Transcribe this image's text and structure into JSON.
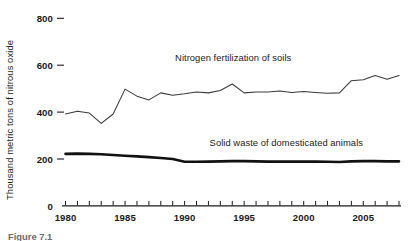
{
  "figure": {
    "caption": "Figure 7.1",
    "background_color": "#ffffff",
    "ink_color": "#1a1a1a"
  },
  "chart_data": {
    "type": "line",
    "title": "",
    "subtitle": "",
    "xlabel": "",
    "ylabel": "Thousand metric tons of nitrous oxide",
    "xlim": [
      1980,
      2008
    ],
    "ylim": [
      0,
      860
    ],
    "grid": false,
    "legend_position": "inline-annotation",
    "y_ticks": [
      0,
      200,
      400,
      600,
      800
    ],
    "y_tick_labels": [
      "0",
      "200",
      "400",
      "600",
      "800"
    ],
    "x_ticks": [
      1980,
      1981,
      1982,
      1983,
      1984,
      1985,
      1986,
      1987,
      1988,
      1989,
      1990,
      1991,
      1992,
      1993,
      1994,
      1995,
      1996,
      1997,
      1998,
      1999,
      2000,
      2001,
      2002,
      2003,
      2004,
      2005,
      2006,
      2007,
      2008
    ],
    "x_tick_labels_shown": [
      "1980",
      "1985",
      "1990",
      "1995",
      "2000",
      "2005"
    ],
    "x_tick_labels_shown_values": [
      1980,
      1985,
      1990,
      1995,
      2000,
      2005
    ],
    "x": [
      1980,
      1981,
      1982,
      1983,
      1984,
      1985,
      1986,
      1987,
      1988,
      1989,
      1990,
      1991,
      1992,
      1993,
      1994,
      1995,
      1996,
      1997,
      1998,
      1999,
      2000,
      2001,
      2002,
      2003,
      2004,
      2005,
      2006,
      2007,
      2008
    ],
    "series": [
      {
        "name": "Nitrogen fertilization of soils",
        "style": "thin",
        "color": "#3a3a3a",
        "label_x": 1989.2,
        "label_y": 618,
        "values": [
          392,
          404,
          396,
          352,
          392,
          498,
          468,
          452,
          482,
          472,
          478,
          486,
          482,
          492,
          520,
          482,
          486,
          486,
          490,
          484,
          488,
          484,
          480,
          482,
          534,
          538,
          556,
          540,
          556
        ]
      },
      {
        "name": "Solid waste of domesticated animals",
        "style": "thick",
        "color": "#111111",
        "label_x": 1992.1,
        "label_y": 256,
        "values": [
          222,
          223,
          222,
          220,
          217,
          214,
          211,
          208,
          204,
          200,
          188,
          188,
          189,
          190,
          191,
          191,
          190,
          189,
          189,
          189,
          189,
          189,
          188,
          187,
          190,
          191,
          191,
          190,
          190
        ]
      }
    ],
    "annotations": [
      {
        "text": "Nitrogen fertilization of soils",
        "x": 1989.2,
        "y": 618
      },
      {
        "text": "Solid waste of domesticated animals",
        "x": 1992.1,
        "y": 256
      }
    ]
  }
}
